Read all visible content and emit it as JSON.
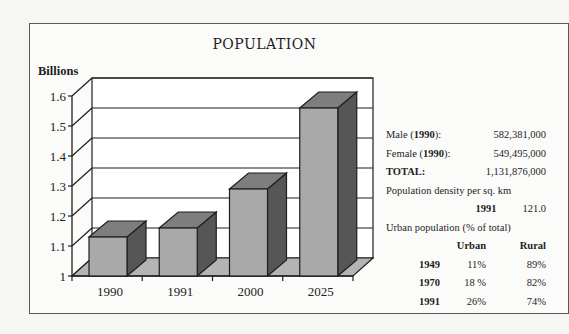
{
  "title": "POPULATION",
  "y_axis_label": "Billions",
  "chart_data": {
    "type": "bar",
    "style": "3d",
    "title": "POPULATION",
    "xlabel": "",
    "ylabel": "Billions",
    "categories": [
      "1990",
      "1991",
      "2000",
      "2025"
    ],
    "values": [
      1.13,
      1.16,
      1.29,
      1.56
    ],
    "ylim": [
      1,
      1.6
    ],
    "yticks": [
      "1",
      "1.1",
      "1.2",
      "1.3",
      "1.4",
      "1.5",
      "1.6"
    ],
    "grid": true,
    "legend": "none",
    "colors": {
      "front": "#a9a9a9",
      "top": "#7e7e7e",
      "side": "#565656",
      "floor": "#b4b4b4"
    }
  },
  "stats": {
    "male_label": "Male (",
    "male_year": "1990",
    "male_suffix": "):",
    "male_value": "582,381,000",
    "female_label": "Female (",
    "female_year": "1990",
    "female_suffix": "):",
    "female_value": "549,495,000",
    "total_label": "TOTAL:",
    "total_value": "1,131,876,000",
    "density_label": "Population density per sq. km",
    "density_year": "1991",
    "density_value": "121.0",
    "urban_label": "Urban population (% of total)",
    "urban_headers": [
      "",
      "Urban",
      "Rural"
    ],
    "urban_rows": [
      {
        "year": "1949",
        "urban": "11%",
        "rural": "89%"
      },
      {
        "year": "1970",
        "urban": "18 %",
        "rural": "82%"
      },
      {
        "year": "1991",
        "urban": "26%",
        "rural": "74%"
      }
    ]
  }
}
